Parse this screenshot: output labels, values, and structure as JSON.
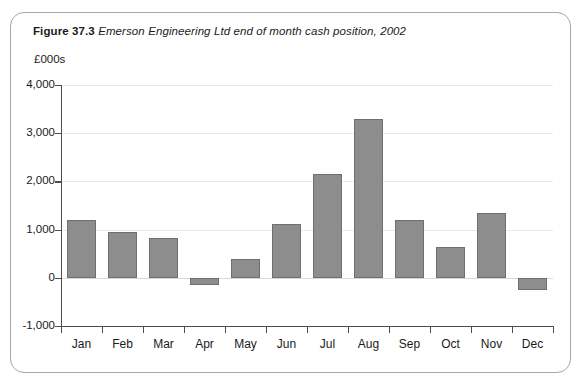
{
  "figure": {
    "number": "Figure 37.3",
    "caption": "Emerson Engineering Ltd end of month cash position, 2002"
  },
  "colors": {
    "bar_fill": "#8d8d8d",
    "bar_stroke": "#6f6f6f",
    "axis": "#4d4d4d",
    "grid": "#e9e9e9",
    "frame_border": "#a8a8a8",
    "background": "#ffffff"
  },
  "chart_data": {
    "type": "bar",
    "title": "Emerson Engineering Ltd end of month cash position, 2002",
    "xlabel": "",
    "ylabel": "£000s",
    "unit_label": "£000s",
    "categories": [
      "Jan",
      "Feb",
      "Mar",
      "Apr",
      "May",
      "Jun",
      "Jul",
      "Aug",
      "Sep",
      "Oct",
      "Nov",
      "Dec"
    ],
    "values": [
      1200,
      950,
      830,
      -150,
      400,
      1120,
      2160,
      3300,
      1190,
      640,
      1340,
      -250
    ],
    "ylim": [
      -1000,
      4000
    ],
    "ytick_values": [
      -1000,
      0,
      1000,
      2000,
      3000,
      4000
    ],
    "ytick_labels": [
      "-1,000",
      "0",
      "1,000",
      "2,000",
      "3,000",
      "4,000"
    ],
    "grid": true,
    "grid_axis": "y",
    "legend": false,
    "legend_position": "none"
  }
}
